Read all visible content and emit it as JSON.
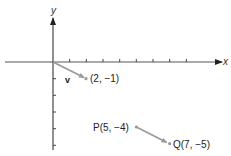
{
  "axes": {
    "x_label": "x",
    "y_label": "y",
    "x_ticks": [
      1,
      2,
      3,
      4,
      5,
      6,
      7,
      8
    ],
    "y_ticks": [
      -1,
      -2,
      -3,
      -4,
      -5
    ],
    "color": "#333333"
  },
  "vectors": [
    {
      "name": "v",
      "label": "v",
      "from": [
        0,
        0
      ],
      "to": [
        2,
        -1
      ],
      "endpoint_label": "(2, −1)",
      "color": "#888888"
    },
    {
      "name": "PQ",
      "from": [
        5,
        -4
      ],
      "to": [
        7,
        -5
      ],
      "start_label": "P(5, −4)",
      "endpoint_label": "Q(7, −5)",
      "color": "#888888"
    }
  ]
}
